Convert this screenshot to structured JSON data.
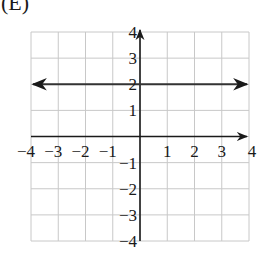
{
  "panel_label": "(E)",
  "chart_data": {
    "type": "line",
    "title": "",
    "xlabel": "",
    "ylabel": "",
    "xlim": [
      -4,
      4
    ],
    "ylim": [
      -4,
      4
    ],
    "grid": true,
    "x_ticks": [
      -4,
      -3,
      -2,
      -1,
      1,
      2,
      3,
      4
    ],
    "y_ticks": [
      4,
      3,
      2,
      1,
      -1,
      -2,
      -3,
      -4
    ],
    "x_tick_labels": [
      "−4",
      "−3",
      "−2",
      "−1",
      "1",
      "2",
      "3",
      "4"
    ],
    "y_tick_labels": [
      "4",
      "3",
      "2",
      "1",
      "−1",
      "−2",
      "−3",
      "−4"
    ],
    "series": [
      {
        "name": "y = 2",
        "equation": "y = 2",
        "x": [
          -4,
          4
        ],
        "y": [
          2,
          2
        ],
        "arrows": "both-ends"
      }
    ],
    "legend": null
  },
  "colors": {
    "grid": "#c8c8c8",
    "axis": "#1a1a1a",
    "line": "#333333",
    "background": "#ffffff"
  }
}
